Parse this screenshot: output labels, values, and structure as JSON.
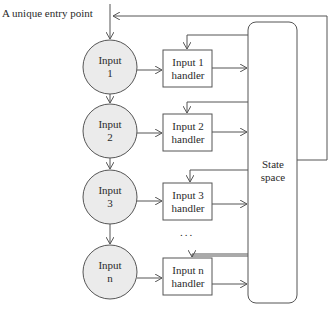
{
  "entry_label": "A unique entry point",
  "inputs": [
    {
      "line1": "Input",
      "line2": "1"
    },
    {
      "line1": "Input",
      "line2": "2"
    },
    {
      "line1": "Input",
      "line2": "3"
    },
    {
      "line1": "Input",
      "line2": "n"
    }
  ],
  "handlers": [
    {
      "line1": "Input 1",
      "line2": "handler"
    },
    {
      "line1": "Input 2",
      "line2": "handler"
    },
    {
      "line1": "Input 3",
      "line2": "handler"
    },
    {
      "line1": "Input n",
      "line2": "handler"
    }
  ],
  "ellipsis": "...",
  "state_space": {
    "line1": "State",
    "line2": "space"
  },
  "colors": {
    "circle_fill": "#ebebeb",
    "stroke": "#555555",
    "box_fill": "#ffffff"
  }
}
